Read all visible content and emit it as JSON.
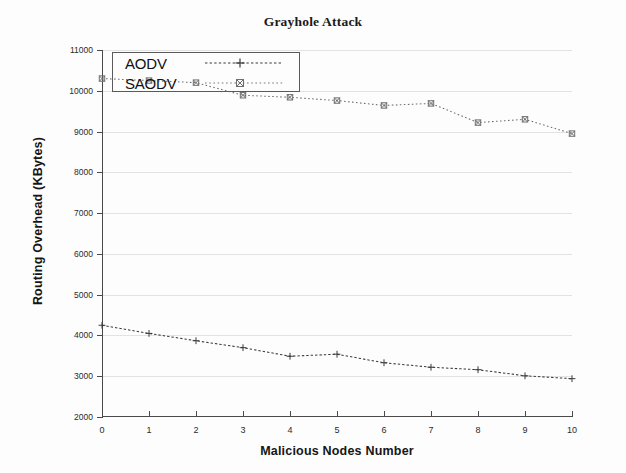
{
  "chart_data": {
    "type": "line",
    "title": "Grayhole Attack",
    "xlabel": "Malicious Nodes Number",
    "ylabel": "Routing Overhead (KBytes)",
    "x": [
      0,
      1,
      2,
      3,
      4,
      5,
      6,
      7,
      8,
      9,
      10
    ],
    "xtick_labels": [
      "0",
      "1",
      "2",
      "3",
      "4",
      "5",
      "6",
      "7",
      "8",
      "9",
      "10"
    ],
    "ytick_labels": [
      "2000",
      "3000",
      "4000",
      "5000",
      "6000",
      "7000",
      "8000",
      "9000",
      "10000",
      "11000"
    ],
    "ytick_values": [
      2000,
      3000,
      4000,
      5000,
      6000,
      7000,
      8000,
      9000,
      10000,
      11000
    ],
    "xlim": [
      0,
      10
    ],
    "ylim": [
      2000,
      11000
    ],
    "grid": true,
    "legend_position": "top-left",
    "series": [
      {
        "name": "AODV",
        "marker": "cross",
        "linestyle": "dotted",
        "color": "#3a3a3a",
        "values": [
          4250,
          4050,
          3870,
          3700,
          3490,
          3540,
          3330,
          3220,
          3160,
          3010,
          2940
        ]
      },
      {
        "name": "SAODV",
        "marker": "square-x",
        "linestyle": "dotted",
        "color": "#6e6e6e",
        "values": [
          10300,
          10250,
          10200,
          9890,
          9840,
          9760,
          9640,
          9690,
          9220,
          9300,
          8950
        ]
      }
    ]
  }
}
